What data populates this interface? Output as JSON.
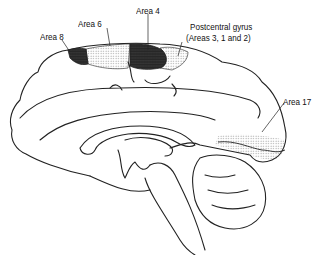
{
  "diagram": {
    "type": "medial view of brain (sagittal section)",
    "labels": {
      "area4": "Area 4",
      "area6": "Area 6",
      "area8": "Area 8",
      "postcentral_line1": "Postcentral gyrus",
      "postcentral_line2": "(Areas 3, 1 and 2)",
      "area17": "Area 17"
    },
    "colors": {
      "line": "#222222",
      "dark_fill": "#1a1a1a",
      "stipple": "#555555",
      "background": "#ffffff"
    }
  }
}
